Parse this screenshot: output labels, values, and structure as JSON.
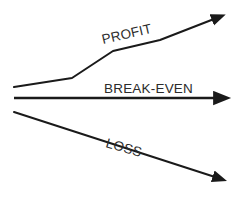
{
  "diagram": {
    "background_color": "#ffffff",
    "stroke_color": "#1a1a1a",
    "text_color": "#2b2b2b",
    "labels": {
      "profit": "PROFIT",
      "break_even": "BREAK-EVEN",
      "loss": "LOSS"
    }
  },
  "chart_data": {
    "type": "line",
    "title": "",
    "xlabel": "",
    "ylabel": "",
    "grid": false,
    "legend": "inline-labels",
    "xlim": [
      14,
      222
    ],
    "ylim": [
      199,
      0
    ],
    "annotations": [
      {
        "text": "PROFIT",
        "x": 103,
        "y": 44,
        "rotation": -13
      },
      {
        "text": "BREAK-EVEN",
        "x": 104,
        "y": 93,
        "rotation": 0
      },
      {
        "text": "LOSS",
        "x": 105,
        "y": 147,
        "rotation": 16
      }
    ],
    "series": [
      {
        "name": "PROFIT",
        "arrow": true,
        "direction": "up-right",
        "points": [
          [
            14,
            87
          ],
          [
            72,
            78
          ],
          [
            113,
            51
          ],
          [
            160,
            40
          ],
          [
            214,
            19
          ]
        ]
      },
      {
        "name": "BREAK-EVEN",
        "arrow": true,
        "direction": "right",
        "points": [
          [
            14,
            98
          ],
          [
            216,
            98
          ]
        ]
      },
      {
        "name": "LOSS",
        "arrow": true,
        "direction": "down-right",
        "points": [
          [
            14,
            112
          ],
          [
            215,
            177
          ]
        ]
      }
    ]
  }
}
